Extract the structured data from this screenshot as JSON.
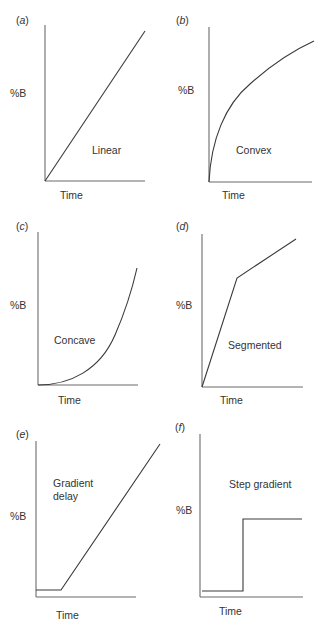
{
  "panels": [
    {
      "id": "a",
      "letter": "a",
      "ylabel": "%B",
      "xlabel": "Time",
      "name": "Linear",
      "name_lines": [
        "Linear"
      ]
    },
    {
      "id": "b",
      "letter": "b",
      "ylabel": "%B",
      "xlabel": "Time",
      "name": "Convex",
      "name_lines": [
        "Convex"
      ]
    },
    {
      "id": "c",
      "letter": "c",
      "ylabel": "%B",
      "xlabel": "Time",
      "name": "Concave",
      "name_lines": [
        "Concave"
      ]
    },
    {
      "id": "d",
      "letter": "d",
      "ylabel": "%B",
      "xlabel": "Time",
      "name": "Segmented",
      "name_lines": [
        "Segmented"
      ]
    },
    {
      "id": "e",
      "letter": "e",
      "ylabel": "%B",
      "xlabel": "Time",
      "name": "Gradient delay",
      "name_lines": [
        "Gradient",
        "delay"
      ]
    },
    {
      "id": "f",
      "letter": "f",
      "ylabel": "%B",
      "xlabel": "Time",
      "name": "Step gradient",
      "name_lines": [
        "Step gradient"
      ]
    }
  ],
  "colors": {
    "axis": "#6b6b6b",
    "curve": "#3a3a3a",
    "text": "#333333",
    "background": "#ffffff"
  }
}
